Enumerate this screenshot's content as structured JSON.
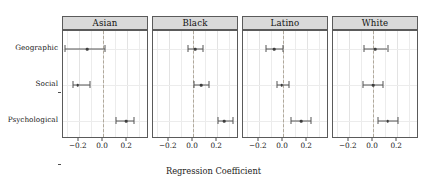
{
  "chart_data": {
    "type": "scatter",
    "plot_style": "faceted-coefficient-forest-plot",
    "title": "",
    "xlabel": "Regression Coefficient",
    "ylabel": "",
    "xlim": [
      -0.33,
      0.38
    ],
    "xticks": [
      -0.2,
      0.0,
      0.2
    ],
    "xticklabels": [
      "-0.2",
      "0.0",
      "0.2"
    ],
    "categories": [
      "Geographic",
      "Social",
      "Psychological"
    ],
    "grid": true,
    "legend": "none",
    "reference_line": {
      "value": 0.0,
      "style": "dashed",
      "color": "#b0a89a"
    },
    "facet_labels": [
      "Asian",
      "Black",
      "Latino",
      "White"
    ],
    "facets": [
      {
        "label": "Asian",
        "points": [
          {
            "category": "Geographic",
            "estimate": -0.13,
            "ci_low": -0.31,
            "ci_high": 0.02
          },
          {
            "category": "Social",
            "estimate": -0.21,
            "ci_low": -0.25,
            "ci_high": -0.11
          },
          {
            "category": "Psychological",
            "estimate": 0.19,
            "ci_low": 0.11,
            "ci_high": 0.26
          }
        ]
      },
      {
        "label": "Black",
        "points": [
          {
            "category": "Geographic",
            "estimate": 0.02,
            "ci_low": -0.04,
            "ci_high": 0.08
          },
          {
            "category": "Social",
            "estimate": 0.07,
            "ci_low": 0.01,
            "ci_high": 0.13
          },
          {
            "category": "Psychological",
            "estimate": 0.26,
            "ci_low": 0.21,
            "ci_high": 0.33
          }
        ]
      },
      {
        "label": "Latino",
        "points": [
          {
            "category": "Geographic",
            "estimate": -0.07,
            "ci_low": -0.14,
            "ci_high": 0.0
          },
          {
            "category": "Social",
            "estimate": -0.01,
            "ci_low": -0.05,
            "ci_high": 0.05
          },
          {
            "category": "Psychological",
            "estimate": 0.15,
            "ci_low": 0.07,
            "ci_high": 0.23
          }
        ]
      },
      {
        "label": "White",
        "points": [
          {
            "category": "Geographic",
            "estimate": 0.02,
            "ci_low": -0.07,
            "ci_high": 0.12
          },
          {
            "category": "Social",
            "estimate": 0.0,
            "ci_low": -0.08,
            "ci_high": 0.08
          },
          {
            "category": "Psychological",
            "estimate": 0.12,
            "ci_low": 0.04,
            "ci_high": 0.21
          }
        ]
      }
    ]
  },
  "colors": {
    "strip_fill": "#d9d9d9",
    "panel_border": "#5a5a5a",
    "grid": "#ececec",
    "reference_line": "#b0a89a",
    "marker": "#3d3d3d",
    "text": "#1a1a1a"
  }
}
